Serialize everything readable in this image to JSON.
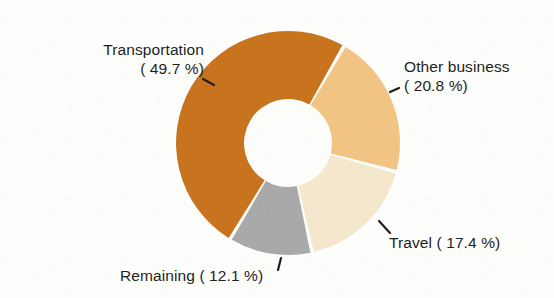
{
  "chart_data": {
    "type": "pie",
    "variant": "donut",
    "title": "",
    "subtitle": "",
    "xlabel": "",
    "ylabel": "",
    "legend_position": "none",
    "labels_position": "outside-with-leader-lines",
    "grid": false,
    "units": "percent",
    "categories": [
      "Transportation",
      "Other business",
      "Travel",
      "Remaining"
    ],
    "values": [
      49.7,
      20.8,
      17.4,
      12.1
    ],
    "colors": [
      "#c8741f",
      "#f1c484",
      "#f4e7cb",
      "#a9a9a9"
    ],
    "slices": [
      {
        "name": "Transportation",
        "value": 49.7,
        "label": "Transportation",
        "value_label": "( 49.7 %)",
        "color": "#c8741f",
        "start_angle_deg": 210.0,
        "end_angle_deg": 388.9
      },
      {
        "name": "Other business",
        "value": 20.8,
        "label": "Other business",
        "value_label": "( 20.8 %)",
        "color": "#f1c484",
        "start_angle_deg": 30.0,
        "end_angle_deg": 104.9
      },
      {
        "name": "Travel",
        "value": 17.4,
        "label": "Travel",
        "value_label": "( 17.4 %)",
        "color": "#f4e7cb",
        "start_angle_deg": 104.9,
        "end_angle_deg": 167.5
      },
      {
        "name": "Remaining",
        "value": 12.1,
        "label": "Remaining",
        "value_label": "( 12.1 %)",
        "color": "#a9a9a9",
        "start_angle_deg": 167.5,
        "end_angle_deg": 211.1
      }
    ]
  },
  "labels": {
    "transportation": {
      "line1": "Transportation",
      "line2": "( 49.7 %)"
    },
    "other_business": {
      "line1": "Other business",
      "line2": "( 20.8 %)"
    },
    "travel": {
      "line1": "Travel ( 17.4 %)"
    },
    "remaining": {
      "line1": "Remaining ( 12.1 %)"
    }
  },
  "colors": {
    "background": "#fdfdfc",
    "text": "#231f1e",
    "transportation": "#c8741f",
    "other_business": "#f1c484",
    "travel": "#f4e7cb",
    "remaining": "#a9a9a9",
    "hole": "#fdfdfc",
    "leader_line": "#231f1e"
  }
}
